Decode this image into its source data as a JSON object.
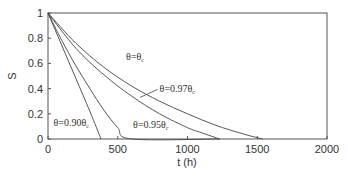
{
  "chart_data": {
    "type": "line",
    "title": "",
    "xlabel": "t (h)",
    "ylabel": "S",
    "xlim": [
      0,
      2000
    ],
    "ylim": [
      0,
      1
    ],
    "xticks": [
      "0",
      "500",
      "1000",
      "1500",
      "2000"
    ],
    "yticks": [
      "0",
      "0.2",
      "0.4",
      "0.6",
      "0.8",
      "1"
    ],
    "grid": false,
    "legend": "none (inline annotations)",
    "series": [
      {
        "name": "θ=θc",
        "label_main": "θ=θ",
        "label_sub": "c",
        "x": [
          0,
          200,
          400,
          600,
          800,
          1000,
          1200,
          1400,
          1540
        ],
        "y": [
          1,
          0.76,
          0.57,
          0.42,
          0.3,
          0.2,
          0.11,
          0.04,
          0
        ]
      },
      {
        "name": "θ=0.97θc",
        "label_main": "θ=0.97θ",
        "label_sub": "c",
        "x": [
          0,
          200,
          400,
          600,
          800,
          1000,
          1100,
          1230
        ],
        "y": [
          1,
          0.72,
          0.51,
          0.34,
          0.2,
          0.09,
          0.05,
          0
        ]
      },
      {
        "name": "θ=0.95θc",
        "label_main": "θ=0.95θ",
        "label_sub": "c",
        "x": [
          0,
          100,
          200,
          300,
          400,
          500,
          600,
          1230
        ],
        "y": [
          1,
          0.78,
          0.58,
          0.4,
          0.23,
          0.09,
          0,
          0
        ]
      },
      {
        "name": "θ=0.90θc",
        "label_main": "θ=0.90θ",
        "label_sub": "c",
        "x": [
          0,
          100,
          200,
          300,
          380
        ],
        "y": [
          1,
          0.74,
          0.48,
          0.22,
          0
        ]
      }
    ],
    "annotations": [
      {
        "text": "θ=θc",
        "x": 560,
        "y": 0.63
      },
      {
        "text": "θ=0.97θc",
        "x": 800,
        "y": 0.37,
        "leader_to": [
          660,
          0.33
        ]
      },
      {
        "text": "θ=0.95θc",
        "x": 610,
        "y": 0.09
      },
      {
        "text": "θ=0.90θc",
        "x": 40,
        "y": 0.1
      }
    ]
  }
}
